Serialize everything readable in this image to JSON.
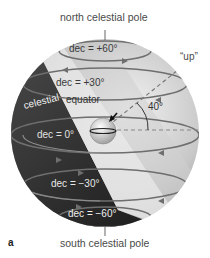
{
  "labels": {
    "north_pole": "north celestial pole",
    "south_pole": "south celestial pole",
    "up": "“up”",
    "angle": "40°",
    "celestial_equator_1": "celestial",
    "celestial_equator_2": "equator",
    "panel": "a"
  },
  "declination_circles": [
    {
      "label": "dec = +60°"
    },
    {
      "label": "dec = +30°"
    },
    {
      "label": "dec = 0°"
    },
    {
      "label": "dec = −30°"
    },
    {
      "label": "dec = −60°"
    }
  ],
  "colors": {
    "sphere_light": "#d9d9d9",
    "sphere_mid": "#a8a8a8",
    "sphere_dark": "#2a2a2a",
    "circle_stroke": "#6e6e6e",
    "text": "#4a4a4a"
  }
}
